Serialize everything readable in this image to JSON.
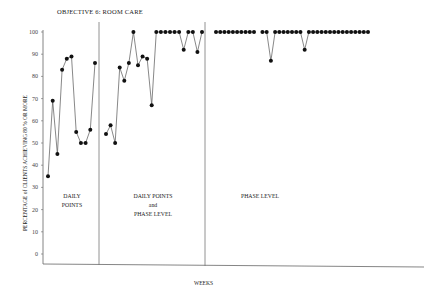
{
  "chart_data": {
    "type": "line",
    "title": "OBJECTIVE 6: ROOM CARE",
    "xlabel": "WEEKS",
    "ylabel": "PERCENTAGE of CLIENTS ACHIEVING 80 % OR MORE",
    "ylim": [
      0,
      100
    ],
    "yticks": [
      0,
      10,
      20,
      30,
      40,
      50,
      60,
      70,
      80,
      90,
      100
    ],
    "grid": false,
    "legend": null,
    "phases": [
      {
        "label": "DAILY POINTS",
        "values": [
          35,
          69,
          45,
          83,
          88,
          89,
          55,
          50,
          50,
          56,
          86
        ]
      },
      {
        "label": "DAILY POINTS and PHASE LEVEL",
        "values": [
          54,
          58,
          50,
          84,
          78,
          86,
          100,
          85,
          89,
          88,
          67,
          100,
          100,
          100,
          100,
          100,
          100,
          92,
          100,
          100,
          91,
          100
        ]
      },
      {
        "label": "PHASE LEVEL",
        "values": [
          100,
          100,
          100,
          100,
          100,
          100,
          100,
          100,
          100,
          100,
          null,
          100,
          100,
          87,
          100,
          100,
          100,
          100,
          100,
          100,
          100,
          92,
          100,
          100,
          100,
          100,
          100,
          100,
          100,
          100,
          100,
          100,
          100,
          100,
          100,
          100,
          100
        ]
      }
    ]
  },
  "labels": {
    "title": "OBJECTIVE 6: ROOM CARE",
    "ylabel": "PERCENTAGE of CLIENTS ACHIEVING 80 % OR MORE",
    "xlabel": "WEEKS",
    "phase1_l1": "DAILY",
    "phase1_l2": "POINTS",
    "phase2_l1": "DAILY POINTS",
    "phase2_l2": "and",
    "phase2_l3": "PHASE LEVEL",
    "phase3_l1": "PHASE LEVEL"
  }
}
